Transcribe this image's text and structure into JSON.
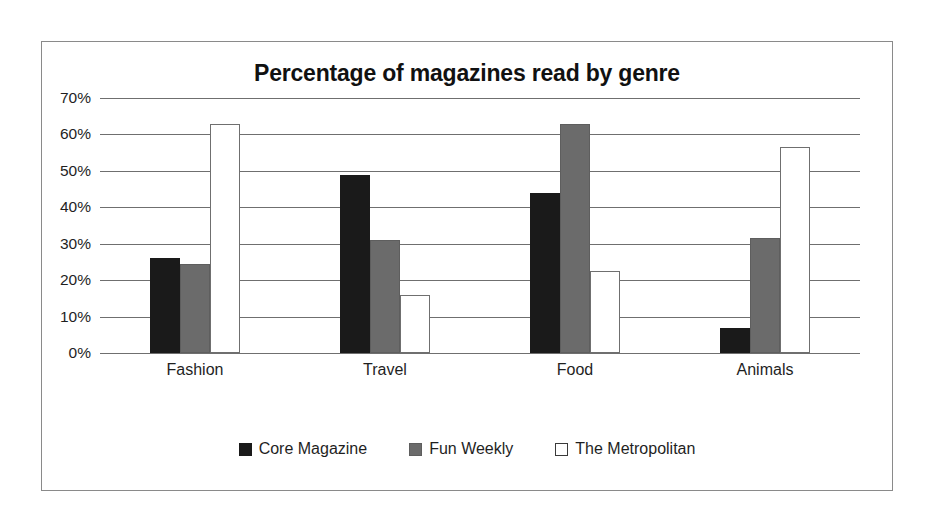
{
  "chart_data": {
    "type": "bar",
    "title": "Percentage of magazines read by genre",
    "xlabel": "",
    "ylabel": "",
    "categories": [
      "Fashion",
      "Travel",
      "Food",
      "Animals"
    ],
    "series": [
      {
        "name": "Core Magazine",
        "color": "#1a1a1a",
        "values": [
          26,
          49,
          44,
          7
        ]
      },
      {
        "name": "Fun Weekly",
        "color": "#6b6b6b",
        "values": [
          24.5,
          31,
          63,
          31.5
        ]
      },
      {
        "name": "The Metropolitan",
        "color": "#ffffff",
        "values": [
          63,
          16,
          22.5,
          56.5
        ]
      }
    ],
    "ylim": [
      0,
      70
    ],
    "ytick_labels": [
      "70%",
      "60%",
      "50%",
      "40%",
      "30%",
      "20%",
      "10%",
      "0%"
    ],
    "ytick_values": [
      70,
      60,
      50,
      40,
      30,
      20,
      10,
      0
    ],
    "grid": true,
    "legend_position": "bottom"
  }
}
